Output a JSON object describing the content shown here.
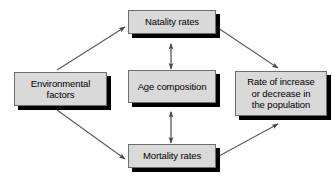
{
  "diagram": {
    "type": "flow-diagram",
    "title": "",
    "background_color": "#ffffff",
    "node_fill_color": "#d9d9d9",
    "node_border_color": "#6e6e6e",
    "node_shadow_color": "#000000",
    "arrow_color": "#555555",
    "text_color": "#000000",
    "nodes": [
      {
        "id": "environmental",
        "label": "Environmental\nfactors",
        "x": 14,
        "y": 72,
        "w": 93,
        "h": 34
      },
      {
        "id": "natality",
        "label": "Natality rates",
        "x": 128,
        "y": 10,
        "w": 88,
        "h": 24
      },
      {
        "id": "age",
        "label": "Age composition",
        "x": 128,
        "y": 70,
        "w": 88,
        "h": 33
      },
      {
        "id": "mortality",
        "label": "Mortality rates",
        "x": 128,
        "y": 144,
        "w": 88,
        "h": 24
      },
      {
        "id": "rate",
        "label": "Rate of increase\nor decrease in\nthe population",
        "x": 235,
        "y": 71,
        "w": 92,
        "h": 45
      }
    ],
    "edges": [
      {
        "id": "environmental-to-natality",
        "from": "environmental",
        "to": "natality",
        "heads": "single"
      },
      {
        "id": "environmental-to-mortality",
        "from": "environmental",
        "to": "mortality",
        "heads": "single"
      },
      {
        "id": "natality-to-rate",
        "from": "natality",
        "to": "rate",
        "heads": "single"
      },
      {
        "id": "mortality-to-rate",
        "from": "mortality",
        "to": "rate",
        "heads": "single"
      },
      {
        "id": "natality-age",
        "from": "natality",
        "to": "age",
        "heads": "double"
      },
      {
        "id": "age-mortality",
        "from": "age",
        "to": "mortality",
        "heads": "double"
      }
    ]
  }
}
